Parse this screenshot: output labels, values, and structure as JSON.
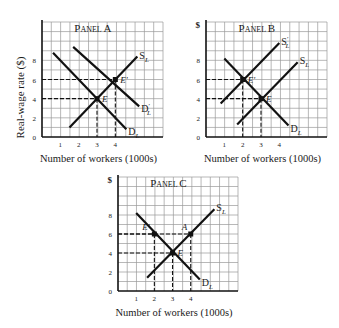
{
  "chart_data": [
    {
      "type": "line",
      "title": "Panel A",
      "xlabel": "Number of workers (1000s)",
      "ylabel": "Real-wage rate ($)",
      "x_ticks": [
        "1",
        "2",
        "3",
        "4"
      ],
      "y_ticks": [
        "0",
        "2",
        "4",
        "6",
        "8"
      ],
      "xlim": [
        0,
        6.6
      ],
      "ylim": [
        0,
        12
      ],
      "grid": true,
      "series": [
        {
          "name": "D_L",
          "label": "D",
          "sub": "L",
          "prime": false,
          "points": [
            [
              0.6,
              8.8
            ],
            [
              4.6,
              0.8
            ]
          ]
        },
        {
          "name": "D'_L",
          "label": "D",
          "sub": "L",
          "prime": true,
          "points": [
            [
              1.7,
              9.4
            ],
            [
              5.3,
              3.2
            ]
          ]
        },
        {
          "name": "S_L",
          "label": "S",
          "sub": "L",
          "prime": false,
          "points": [
            [
              1.5,
              1.0
            ],
            [
              5.2,
              8.4
            ]
          ]
        }
      ],
      "points": [
        {
          "label": "E",
          "x": 3,
          "y": 4
        },
        {
          "label": "E'",
          "x": 4,
          "y": 6
        }
      ],
      "dashed_guides": [
        {
          "x": 3,
          "y": 4
        },
        {
          "x": 4,
          "y": 6
        }
      ]
    },
    {
      "type": "line",
      "title": "Panel B",
      "xlabel": "Number of workers (1000s)",
      "ylabel": "$",
      "x_ticks": [
        "1",
        "2",
        "3",
        "4"
      ],
      "y_ticks": [
        "0",
        "2",
        "4",
        "6",
        "8"
      ],
      "xlim": [
        0,
        6.6
      ],
      "ylim": [
        0,
        12
      ],
      "grid": true,
      "series": [
        {
          "name": "D_L",
          "label": "D",
          "sub": "L",
          "prime": false,
          "points": [
            [
              1.0,
              8.2
            ],
            [
              4.5,
              1.2
            ]
          ]
        },
        {
          "name": "S'_L",
          "label": "S",
          "sub": "L",
          "prime": true,
          "points": [
            [
              0.8,
              3.5
            ],
            [
              4.0,
              9.8
            ]
          ]
        },
        {
          "name": "S_L",
          "label": "S",
          "sub": "L",
          "prime": false,
          "points": [
            [
              1.7,
              1.3
            ],
            [
              5.0,
              7.8
            ]
          ]
        }
      ],
      "points": [
        {
          "label": "E'",
          "x": 2,
          "y": 6
        },
        {
          "label": "E",
          "x": 3,
          "y": 4
        }
      ],
      "dashed_guides": [
        {
          "x": 2,
          "y": 6
        },
        {
          "x": 3,
          "y": 4
        }
      ]
    },
    {
      "type": "line",
      "title": "Panel C",
      "xlabel": "Number of workers (1000s)",
      "ylabel": "$",
      "x_ticks": [
        "1",
        "2",
        "3",
        "4"
      ],
      "y_ticks": [
        "0",
        "2",
        "4",
        "6",
        "8"
      ],
      "xlim": [
        0,
        6.6
      ],
      "ylim": [
        0,
        12
      ],
      "grid": true,
      "series": [
        {
          "name": "D_L",
          "label": "D",
          "sub": "L",
          "prime": false,
          "points": [
            [
              1.0,
              8.2
            ],
            [
              4.5,
              1.2
            ]
          ]
        },
        {
          "name": "S_L",
          "label": "S",
          "sub": "L",
          "prime": false,
          "points": [
            [
              1.6,
              1.4
            ],
            [
              5.3,
              8.6
            ]
          ]
        }
      ],
      "points": [
        {
          "label": "E",
          "x": 3,
          "y": 4
        },
        {
          "label": "E'",
          "x": 2,
          "y": 6
        },
        {
          "label": "A",
          "x": 4,
          "y": 6
        }
      ],
      "dashed_guides": [
        {
          "x": 3,
          "y": 4
        },
        {
          "x": 2,
          "y": 6
        },
        {
          "x": 4,
          "y": 6
        }
      ]
    }
  ],
  "panels": {
    "a": {
      "title": "Panel A",
      "ylabel": "Real-wage rate ($)",
      "xlabel": "Number of workers (1000s)"
    },
    "b": {
      "title": "Panel B",
      "ylabel": "$",
      "xlabel": "Number of workers (1000s)"
    },
    "c": {
      "title": "Panel C",
      "ylabel": "$",
      "xlabel": "Number of workers (1000s)"
    }
  }
}
